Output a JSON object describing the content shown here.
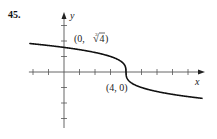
{
  "problem_number": "45.",
  "chart_data": {
    "type": "line",
    "title": "",
    "function": "y = cbrt(4 - x)",
    "xlabel": "x",
    "ylabel": "y",
    "xlim": [
      -2.2,
      9
    ],
    "ylim": [
      -3.6,
      3.7
    ],
    "x_ticks": [
      -2,
      -1,
      1,
      2,
      3,
      4,
      5,
      6,
      7,
      8
    ],
    "y_ticks": [
      -3,
      -2,
      -1,
      1,
      2,
      3
    ],
    "tick_labels_shown": false,
    "grid": false,
    "series": [
      {
        "name": "curve",
        "x": [
          -2.2,
          -1,
          0,
          1,
          2,
          3,
          3.5,
          3.9,
          4,
          4.1,
          4.5,
          5,
          6,
          7,
          8,
          8.9
        ],
        "y": [
          1.837,
          1.71,
          1.587,
          1.442,
          1.26,
          1.0,
          0.794,
          0.464,
          0,
          -0.464,
          -0.794,
          -1.0,
          -1.26,
          -1.442,
          -1.587,
          -1.698
        ]
      }
    ],
    "annotations": [
      {
        "text": "(0, ∛4)",
        "point": [
          0,
          1.587
        ]
      },
      {
        "text": "(4, 0)",
        "point": [
          4,
          0
        ]
      }
    ]
  },
  "labels": {
    "y_axis": "y",
    "x_axis": "x",
    "point_a_prefix": "(0, ",
    "point_a_root_index": "3",
    "point_a_radicand": "4",
    "point_a_suffix": ")",
    "point_b": "(4, 0)"
  },
  "colors": {
    "axis": "#555555",
    "curve": "#111111",
    "text": "#222222"
  }
}
